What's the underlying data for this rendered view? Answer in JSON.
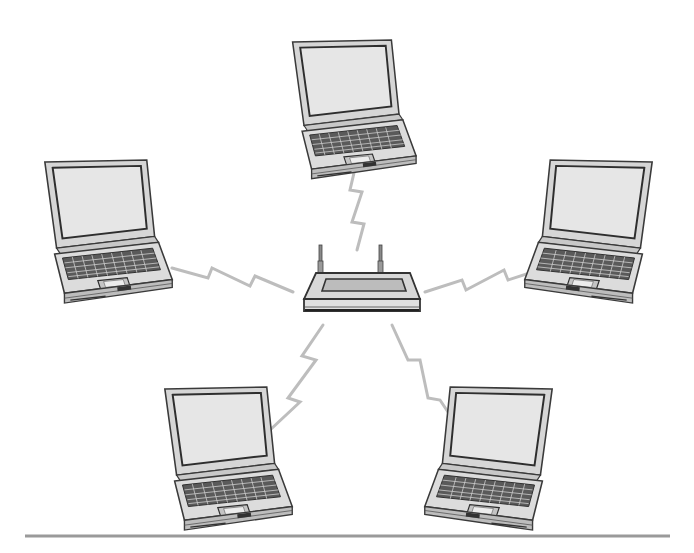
{
  "diagram": {
    "type": "wireless-network-star-topology",
    "hub": {
      "id": "router",
      "kind": "wireless-router",
      "x": 358,
      "y": 285,
      "antennas": 2
    },
    "nodes": [
      {
        "id": "laptop-top",
        "kind": "laptop",
        "x": 355,
        "y": 100,
        "facing": "front"
      },
      {
        "id": "laptop-left",
        "kind": "laptop",
        "x": 108,
        "y": 218,
        "facing": "left"
      },
      {
        "id": "laptop-right",
        "kind": "laptop",
        "x": 592,
        "y": 218,
        "facing": "right"
      },
      {
        "id": "laptop-bottom-left",
        "kind": "laptop",
        "x": 225,
        "y": 445,
        "facing": "left"
      },
      {
        "id": "laptop-bottom-right",
        "kind": "laptop",
        "x": 490,
        "y": 445,
        "facing": "right"
      }
    ],
    "links": [
      {
        "from": "router",
        "to": "laptop-top",
        "style": "lightning-bolt"
      },
      {
        "from": "router",
        "to": "laptop-left",
        "style": "lightning-bolt"
      },
      {
        "from": "router",
        "to": "laptop-right",
        "style": "lightning-bolt"
      },
      {
        "from": "router",
        "to": "laptop-bottom-left",
        "style": "lightning-bolt"
      },
      {
        "from": "router",
        "to": "laptop-bottom-right",
        "style": "lightning-bolt"
      }
    ],
    "colors": {
      "background": "#ffffff",
      "outline": "#3a3a3a",
      "body_fill": "#d9d9d9",
      "screen_fill": "#e4e4e4",
      "keys": "#4a4a4a",
      "link": "#bdbdbd",
      "rule": "#9a9a9a"
    },
    "footer_rule": {
      "x1": 25,
      "x2": 670,
      "y": 536
    }
  }
}
